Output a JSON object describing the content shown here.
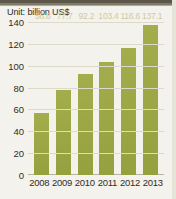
{
  "figure": {
    "unit_label": "Unit: billion US$",
    "bar_color": "#9aa544",
    "label_color": "#cfc9a4",
    "background": "#f4f2ec",
    "grid_color": "#dedacb"
  },
  "chart_data": {
    "type": "bar",
    "title": "",
    "subtitle": "",
    "xlabel": "",
    "ylabel": "Unit: billion US$",
    "categories": [
      "2008",
      "2009",
      "2010",
      "2011",
      "2012",
      "2013"
    ],
    "values": [
      56.6,
      77.7,
      92.2,
      103.4,
      116.6,
      137.1
    ],
    "value_labels": [
      "56.6",
      "77.7",
      "92.2",
      "103.4",
      "116.6",
      "137.1"
    ],
    "ylim": [
      0,
      140
    ],
    "yticks": [
      0,
      20,
      40,
      60,
      80,
      100,
      120,
      140
    ],
    "ytick_labels": [
      "0",
      "20",
      "40",
      "60",
      "80",
      "100",
      "120",
      "140"
    ],
    "grid": true,
    "grid_axis": "y",
    "legend": false,
    "legend_position": "none"
  }
}
